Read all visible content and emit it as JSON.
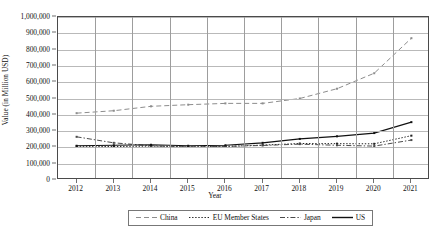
{
  "chart_data": {
    "type": "line",
    "title": "",
    "xlabel": "Year",
    "ylabel": "Value (in Million USD)",
    "x": [
      2012,
      2013,
      2014,
      2015,
      2016,
      2017,
      2018,
      2019,
      2020,
      2021
    ],
    "xtick_labels": [
      "2012",
      "2013",
      "2014",
      "2015",
      "2016",
      "2017",
      "2018",
      "2019",
      "2020",
      "2021"
    ],
    "ytick_labels": [
      "0",
      "100,000",
      "200,000",
      "300,000",
      "400,000",
      "500,000",
      "600,000",
      "700,000",
      "800,000",
      "900,000",
      "1,000,000"
    ],
    "ylim": [
      0,
      1000000
    ],
    "ytick_step": 100000,
    "grid": "both",
    "legend_position": "bottom-center",
    "series": [
      {
        "name": "China",
        "style": "dashed",
        "color": "#8d8d8d",
        "values": [
          410000,
          425000,
          452000,
          462000,
          470000,
          470000,
          500000,
          560000,
          655000,
          870000
        ]
      },
      {
        "name": "EU Member States",
        "style": "dotted",
        "color": "#222222",
        "values": [
          207000,
          205000,
          208000,
          203000,
          206000,
          214000,
          224000,
          223000,
          222000,
          272000
        ]
      },
      {
        "name": "Japan",
        "style": "dash-dot",
        "color": "#4a4a4a",
        "values": [
          265000,
          228000,
          210000,
          203000,
          206000,
          212000,
          220000,
          213000,
          208000,
          245000
        ]
      },
      {
        "name": "US",
        "style": "solid",
        "color": "#111111",
        "values": [
          210000,
          213000,
          216000,
          210000,
          213000,
          228000,
          252000,
          268000,
          288000,
          355000
        ]
      }
    ]
  },
  "legend": {
    "items": [
      {
        "label": "China"
      },
      {
        "label": "EU Member States"
      },
      {
        "label": "Japan"
      },
      {
        "label": "US"
      }
    ]
  }
}
